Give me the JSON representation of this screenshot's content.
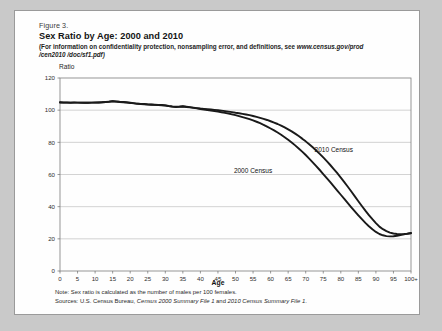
{
  "figure": {
    "label": "Figure 3.",
    "title": "Sex Ratio by Age: 2000 and 2010",
    "note_line1": "(For information on confidentiality protection, nonsampling error, and definitions, see ",
    "note_url": "www.census.gov/prod",
    "note_line2": "/cen2010 /doc/sf1.pdf)",
    "note_full": "(For information on confidentiality protection, nonsampling error, and definitions, see www.census.gov/prod /cen2010 /doc/sf1.pdf)"
  },
  "footnotes": {
    "note": "Note: Sex ratio is calculated as the number of males per 100 females.",
    "note_prefix": "Note: Sex ratio is calculated as the number of males per 100 females.",
    "sources_prefix": "Sources: U.S. Census Bureau, ",
    "sources_italic1": "Census 2000 Summary File 1",
    "sources_mid": " and ",
    "sources_italic2": "2010 Census Summary File 1",
    "sources_end": ".",
    "sources_full": "Sources: U.S. Census Bureau, Census 2000 Summary File 1 and 2010 Census Summary File 1."
  },
  "chart_data": {
    "type": "line",
    "title": "Sex Ratio by Age: 2000 and 2010",
    "xlabel": "Age",
    "ylabel": "Ratio",
    "ylim": [
      0,
      120
    ],
    "yticks": [
      0,
      20,
      40,
      60,
      80,
      100,
      120
    ],
    "xlim": [
      0,
      100
    ],
    "xticks": [
      0,
      5,
      10,
      15,
      20,
      25,
      30,
      35,
      40,
      45,
      50,
      55,
      60,
      65,
      70,
      75,
      80,
      85,
      90,
      95,
      100
    ],
    "xticklabels": [
      "0",
      "5",
      "10",
      "15",
      "20",
      "25",
      "30",
      "35",
      "40",
      "45",
      "50",
      "55",
      "60",
      "65",
      "70",
      "75",
      "80",
      "85",
      "90",
      "95",
      "100+"
    ],
    "grid": "horizontal",
    "legend": "inline-annotations",
    "x": [
      0,
      1,
      2,
      3,
      4,
      5,
      6,
      7,
      8,
      9,
      10,
      11,
      12,
      13,
      14,
      15,
      16,
      17,
      18,
      19,
      20,
      21,
      22,
      23,
      24,
      25,
      26,
      27,
      28,
      29,
      30,
      31,
      32,
      33,
      34,
      35,
      36,
      37,
      38,
      39,
      40,
      41,
      42,
      43,
      44,
      45,
      46,
      47,
      48,
      49,
      50,
      51,
      52,
      53,
      54,
      55,
      56,
      57,
      58,
      59,
      60,
      61,
      62,
      63,
      64,
      65,
      66,
      67,
      68,
      69,
      70,
      71,
      72,
      73,
      74,
      75,
      76,
      77,
      78,
      79,
      80,
      81,
      82,
      83,
      84,
      85,
      86,
      87,
      88,
      89,
      90,
      91,
      92,
      93,
      94,
      95,
      96,
      97,
      98,
      99,
      100
    ],
    "series": [
      {
        "name": "2010 Census",
        "color": "#1a1a1a",
        "label_x": 78,
        "label_y": 74,
        "values": [
          104.9,
          104.8,
          104.8,
          104.7,
          104.8,
          104.7,
          104.7,
          104.6,
          104.6,
          104.7,
          104.8,
          104.8,
          104.9,
          105.0,
          105.2,
          105.6,
          105.4,
          105.2,
          105.1,
          104.9,
          104.7,
          104.4,
          104.1,
          103.9,
          103.8,
          103.6,
          103.5,
          103.4,
          103.3,
          103.2,
          103.0,
          102.6,
          102.3,
          102.1,
          102.2,
          102.4,
          102.2,
          101.9,
          101.6,
          101.3,
          101.0,
          100.8,
          100.6,
          100.4,
          100.2,
          100.0,
          99.7,
          99.4,
          99.1,
          98.8,
          98.4,
          98.1,
          97.7,
          97.3,
          96.9,
          96.4,
          95.8,
          95.2,
          94.6,
          93.9,
          93.1,
          92.3,
          91.4,
          90.4,
          89.3,
          88.1,
          86.8,
          85.4,
          83.9,
          82.3,
          80.6,
          78.8,
          76.9,
          74.9,
          72.8,
          70.6,
          68.3,
          65.9,
          63.4,
          60.8,
          58.1,
          55.3,
          52.4,
          49.4,
          46.4,
          43.4,
          40.4,
          37.5,
          34.8,
          32.2,
          29.8,
          27.6,
          26.0,
          24.8,
          23.9,
          23.3,
          23.0,
          22.9,
          23.0,
          23.2,
          23.5
        ]
      },
      {
        "name": "2000 Census",
        "color": "#1a1a1a",
        "label_x": 55,
        "label_y": 61,
        "values": [
          104.8,
          104.7,
          104.7,
          104.6,
          104.7,
          104.7,
          104.6,
          104.6,
          104.6,
          104.7,
          104.7,
          104.8,
          104.9,
          105.1,
          105.3,
          105.5,
          105.3,
          105.1,
          104.9,
          104.7,
          104.5,
          104.2,
          103.9,
          103.8,
          103.7,
          103.5,
          103.4,
          103.3,
          103.2,
          103.1,
          102.9,
          102.5,
          102.2,
          102.0,
          102.1,
          102.3,
          102.0,
          101.7,
          101.4,
          101.1,
          100.7,
          100.4,
          100.1,
          99.8,
          99.5,
          99.1,
          98.7,
          98.3,
          97.9,
          97.4,
          96.9,
          96.3,
          95.7,
          95.1,
          94.4,
          93.6,
          92.8,
          91.9,
          90.9,
          89.8,
          88.6,
          87.4,
          86.1,
          84.7,
          83.2,
          81.6,
          79.9,
          78.1,
          76.2,
          74.2,
          72.1,
          69.9,
          67.6,
          65.2,
          62.8,
          60.3,
          57.8,
          55.2,
          52.6,
          50.0,
          47.4,
          44.8,
          42.2,
          39.6,
          37.1,
          34.6,
          32.2,
          29.9,
          27.8,
          25.9,
          24.3,
          23.0,
          22.2,
          21.7,
          21.5,
          21.6,
          21.9,
          22.3,
          22.8,
          23.2,
          23.6
        ]
      }
    ]
  }
}
